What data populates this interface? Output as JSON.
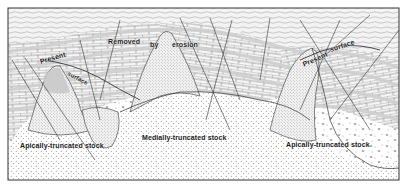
{
  "figure": {
    "type": "geologic-cross-section",
    "frame": {
      "x": 8,
      "y": 8,
      "width": 391,
      "height": 172
    },
    "colors": {
      "ink": "#3a3a3a",
      "paper": "#ffffff",
      "limestone_fill": "#f4f4f4",
      "shale_band": "#d9d9d9",
      "overburden": "#e8e8e8"
    }
  },
  "labels": {
    "removed": "Removed",
    "by": "by",
    "erosion": "erosion",
    "present_left": "Present",
    "surface_left": "surface",
    "present_right": "Present",
    "surface_right": "surface",
    "stock_left": "Apically-truncated stock",
    "stock_middle": "Medially-truncated stock",
    "stock_right": "Apically-truncated stock"
  },
  "units": [
    {
      "name": "overburden",
      "pattern": "stippled-wavy"
    },
    {
      "name": "bedded-limestone",
      "pattern": "brick"
    },
    {
      "name": "shale-bands",
      "pattern": "gray-band"
    },
    {
      "name": "intrusive-stock",
      "pattern": "dotted"
    },
    {
      "name": "basement-granite",
      "pattern": "v-marks"
    }
  ]
}
